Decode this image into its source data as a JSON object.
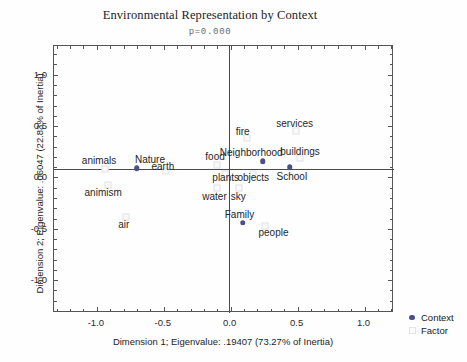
{
  "chart": {
    "title": "Environmental Representation by Context",
    "subtitle": "p=0.000",
    "xlabel": "Dimension 1; Eigenvalue: .19407 (73.27% of Inertia)",
    "ylabel": "Dimension 2; Eigenvalue: .06047 (22.83% of Inertia)"
  },
  "legend": {
    "context_label": "Context",
    "factor_label": "Factor"
  },
  "ticks": {
    "x": [
      "-1.0",
      "-0.5",
      "0.0",
      "0.5",
      "1.0"
    ],
    "y": [
      "1.0",
      "0.5",
      "0.0",
      "-0.5",
      "-1.0"
    ]
  },
  "chart_data": {
    "type": "scatter",
    "title": "Environmental Representation by Context",
    "subtitle": "p=0.000",
    "xlabel": "Dimension 1; Eigenvalue: .19407 (73.27% of Inertia)",
    "ylabel": "Dimension 2; Eigenvalue: .06047 (22.83% of Inertia)",
    "xlim": [
      -1.32,
      1.22
    ],
    "ylim": [
      -1.32,
      1.28
    ],
    "xticks": [
      -1.0,
      -0.5,
      0.0,
      0.5,
      1.0
    ],
    "yticks": [
      -1.0,
      -0.5,
      0.0,
      0.5,
      1.0
    ],
    "grid": false,
    "legend_position": "outside-bottom-right",
    "series": [
      {
        "name": "Context",
        "marker": "filled-circle",
        "color": "#4a4f86",
        "points": [
          {
            "label": "Nature",
            "x": -0.7,
            "y": 0.09,
            "label_dx": -1,
            "label_dy": -13
          },
          {
            "label": "Neighborhood",
            "x": 0.24,
            "y": 0.16,
            "label_dx": -42,
            "label_dy": -13
          },
          {
            "label": "School",
            "x": 0.44,
            "y": 0.1,
            "label_dx": -12,
            "label_dy": 5
          },
          {
            "label": "Family",
            "x": 0.09,
            "y": -0.44,
            "label_dx": -17,
            "label_dy": -13
          }
        ]
      },
      {
        "name": "Factor",
        "marker": "open-square",
        "color": "#e4e4e8",
        "points": [
          {
            "label": "animals",
            "x": -0.94,
            "y": 0.08,
            "label_dx": -22,
            "label_dy": -13
          },
          {
            "label": "earth",
            "x": -0.48,
            "y": 0.06,
            "label_dx": -14,
            "label_dy": -9
          },
          {
            "label": "animism",
            "x": -0.92,
            "y": -0.07,
            "label_dx": -22,
            "label_dy": 3
          },
          {
            "label": "air",
            "x": -0.78,
            "y": -0.39,
            "label_dx": -7,
            "label_dy": 3
          },
          {
            "label": "food",
            "x": -0.1,
            "y": 0.12,
            "label_dx": -11,
            "label_dy": -13
          },
          {
            "label": "plants",
            "x": -0.04,
            "y": 0.03,
            "label_dx": -12,
            "label_dy": -1
          },
          {
            "label": "water",
            "x": -0.1,
            "y": -0.1,
            "label_dx": -14,
            "label_dy": 4
          },
          {
            "label": "sky",
            "x": 0.06,
            "y": -0.1,
            "label_dx": -7,
            "label_dy": 4
          },
          {
            "label": "fire",
            "x": 0.12,
            "y": 0.38,
            "label_dx": -10,
            "label_dy": -11
          },
          {
            "label": "objects",
            "x": 0.17,
            "y": 0.03,
            "label_dx": -15,
            "label_dy": -1
          },
          {
            "label": "buildings",
            "x": 0.52,
            "y": 0.19,
            "label_dx": -19,
            "label_dy": -11
          },
          {
            "label": "services",
            "x": 0.49,
            "y": 0.45,
            "label_dx": -19,
            "label_dy": -12
          },
          {
            "label": "people",
            "x": 0.26,
            "y": -0.47,
            "label_dx": -6,
            "label_dy": 2
          }
        ]
      }
    ]
  }
}
